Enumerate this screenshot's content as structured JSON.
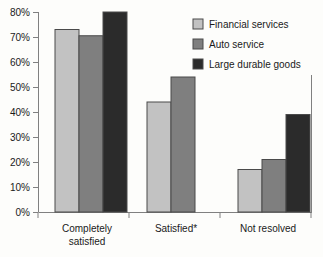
{
  "chart_data": {
    "type": "bar",
    "title": "",
    "subtitle": "",
    "xlabel": "",
    "ylabel": "",
    "categories": [
      "Completely satisfied",
      "Satisfied*",
      "Not resolved"
    ],
    "category_lines": [
      [
        "Completely",
        "satisfied"
      ],
      [
        "Satisfied*"
      ],
      [
        "Not resolved"
      ]
    ],
    "series": [
      {
        "name": "Financial services",
        "color": "#c2c2c2",
        "values": [
          73,
          44,
          17
        ]
      },
      {
        "name": "Auto service",
        "color": "#7f7f7f",
        "values": [
          70.5,
          54,
          21
        ]
      },
      {
        "name": "Large durable goods",
        "color": "#2b2b2b",
        "values": [
          80,
          null,
          39
        ]
      }
    ],
    "ylim": [
      0,
      80
    ],
    "ytick_step": 10,
    "ytick_labels": [
      "0%",
      "10%",
      "20%",
      "30%",
      "40%",
      "50%",
      "60%",
      "70%",
      "80%"
    ],
    "grid": false,
    "legend_position": "top-right",
    "axis_color": "#808080",
    "bar_border_color": "#4a4a4a",
    "background_color": "#fdfdfb"
  }
}
